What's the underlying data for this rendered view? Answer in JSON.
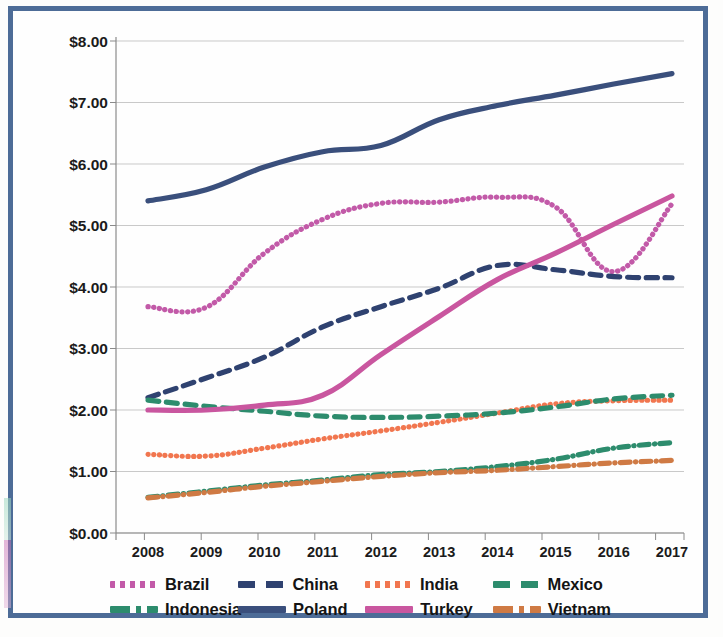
{
  "chart_data": {
    "type": "line",
    "title": "",
    "xlabel": "",
    "ylabel": "",
    "x": [
      2008,
      2009,
      2010,
      2011,
      2012,
      2013,
      2014,
      2015,
      2016,
      2017
    ],
    "categories": [
      "2008",
      "2009",
      "2010",
      "2011",
      "2012",
      "2013",
      "2014",
      "2015",
      "2016",
      "2017"
    ],
    "ylim": [
      0,
      8
    ],
    "ytick_labels": [
      "$0.00",
      "$1.00",
      "$2.00",
      "$3.00",
      "$4.00",
      "$5.00",
      "$6.00",
      "$7.00",
      "$8.00"
    ],
    "ytick_values": [
      0,
      1,
      2,
      3,
      4,
      5,
      6,
      7,
      8
    ],
    "grid": true,
    "legend_position": "bottom",
    "series": [
      {
        "name": "Brazil",
        "color": "#c25aa8",
        "style": "dotted",
        "values": [
          3.68,
          3.67,
          4.55,
          5.1,
          5.36,
          5.38,
          5.46,
          5.3,
          4.25,
          5.35
        ]
      },
      {
        "name": "China",
        "color": "#2f4270",
        "style": "dashed",
        "values": [
          2.2,
          2.52,
          2.86,
          3.35,
          3.68,
          3.98,
          4.35,
          4.28,
          4.17,
          4.15
        ]
      },
      {
        "name": "India",
        "color": "#f1764f",
        "style": "dotted",
        "values": [
          1.28,
          1.25,
          1.38,
          1.53,
          1.66,
          1.8,
          1.95,
          2.1,
          2.15,
          2.16
        ]
      },
      {
        "name": "Mexico",
        "color": "#2d8c6d",
        "style": "dashed",
        "values": [
          2.16,
          2.06,
          1.98,
          1.9,
          1.88,
          1.9,
          1.95,
          2.05,
          2.18,
          2.24
        ]
      },
      {
        "name": "Indonesia",
        "color": "#2d8c6d",
        "style": "dash-dot",
        "values": [
          0.58,
          0.68,
          0.78,
          0.86,
          0.95,
          1.0,
          1.08,
          1.2,
          1.38,
          1.47
        ]
      },
      {
        "name": "Poland",
        "color": "#3a4f7c",
        "style": "solid",
        "values": [
          5.4,
          5.58,
          5.95,
          6.2,
          6.3,
          6.72,
          6.95,
          7.12,
          7.3,
          7.47
        ]
      },
      {
        "name": "Turkey",
        "color": "#c9569f",
        "style": "solid",
        "values": [
          2.0,
          2.0,
          2.08,
          2.24,
          2.9,
          3.52,
          4.12,
          4.55,
          5.02,
          5.48
        ]
      },
      {
        "name": "Vietnam",
        "color": "#cf7a44",
        "style": "dash-dot",
        "values": [
          0.57,
          0.66,
          0.76,
          0.84,
          0.92,
          0.98,
          1.02,
          1.08,
          1.14,
          1.18
        ]
      }
    ]
  },
  "legend": {
    "row1": [
      {
        "label": "Brazil",
        "key": "Brazil"
      },
      {
        "label": "China",
        "key": "China"
      },
      {
        "label": "India",
        "key": "India"
      },
      {
        "label": "Mexico",
        "key": "Mexico"
      }
    ],
    "row2": [
      {
        "label": "Indonesia",
        "key": "Indonesia"
      },
      {
        "label": "Poland",
        "key": "Poland"
      },
      {
        "label": "Turkey",
        "key": "Turkey"
      },
      {
        "label": "Vietnam",
        "key": "Vietnam"
      }
    ]
  },
  "colors": {
    "frame": "#4a6a96",
    "grid": "#c9c9c9",
    "axis": "#8a8a8a",
    "text": "#1b1b1b"
  }
}
